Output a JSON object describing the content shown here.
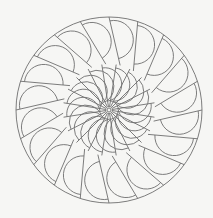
{
  "artwork": {
    "title": "Spiral half-disc mandala line art",
    "type": "coloring-page",
    "line_color": "#6e6e6e",
    "background_color": "#f6f6f4",
    "center": [
      109,
      110
    ],
    "outer_radius": 93,
    "outer_ring": {
      "count": 20,
      "inner_radius": 46,
      "rotation_deg": -90
    },
    "inner_ring": {
      "count": 20,
      "inner_radius": 3,
      "outer_radius": 46,
      "rotation_deg": -81
    },
    "center_dot_radius": 2
  }
}
